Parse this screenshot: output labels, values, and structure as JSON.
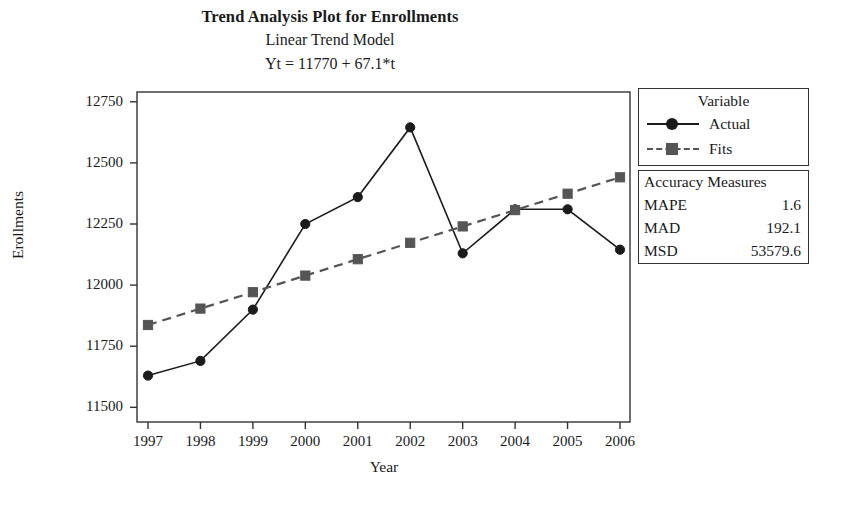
{
  "titles": {
    "main": "Trend Analysis Plot for Enrollments",
    "sub": "Linear Trend Model",
    "equation": "Yt = 11770 + 67.1*t"
  },
  "legend": {
    "title": "Variable",
    "items": [
      {
        "label": "Actual",
        "style": "solid",
        "marker": "circle",
        "color": "#1b1b1b"
      },
      {
        "label": "Fits",
        "style": "dashed",
        "marker": "square",
        "color": "#555555"
      }
    ]
  },
  "accuracy": {
    "title": "Accuracy Measures",
    "rows": [
      {
        "name": "MAPE",
        "value": "1.6"
      },
      {
        "name": "MAD",
        "value": "192.1"
      },
      {
        "name": "MSD",
        "value": "53579.6"
      }
    ]
  },
  "chart_data": {
    "type": "line",
    "title": "Trend Analysis Plot for Enrollments",
    "subtitle": "Linear Trend Model",
    "annotation": "Yt = 11770 + 67.1*t",
    "xlabel": "Year",
    "ylabel": "Erollments",
    "categories": [
      1997,
      1998,
      1999,
      2000,
      2001,
      2002,
      2003,
      2004,
      2005,
      2006
    ],
    "xtick_labels": [
      "1997",
      "1998",
      "1999",
      "2000",
      "2001",
      "2002",
      "2003",
      "2004",
      "2005",
      "2006"
    ],
    "ytick_labels": [
      "11500",
      "11750",
      "12000",
      "12250",
      "12500",
      "12750"
    ],
    "yticks": [
      11500,
      11750,
      12000,
      12250,
      12500,
      12750
    ],
    "ylim": [
      11440,
      12790
    ],
    "grid": false,
    "legend_position": "right",
    "series": [
      {
        "name": "Actual",
        "marker": "circle",
        "linestyle": "solid",
        "color": "#1b1b1b",
        "values": [
          11630,
          11690,
          11900,
          12250,
          12360,
          12645,
          12130,
          12310,
          12310,
          12145
        ]
      },
      {
        "name": "Fits",
        "marker": "square",
        "linestyle": "dashed",
        "color": "#555555",
        "values": [
          11837,
          11904,
          11971,
          12039,
          12106,
          12173,
          12240,
          12307,
          12374,
          12441
        ]
      }
    ]
  }
}
